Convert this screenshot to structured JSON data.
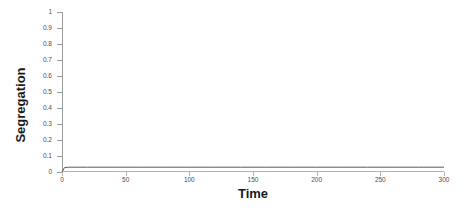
{
  "chart_data": {
    "type": "line",
    "title": "",
    "xlabel": "Time",
    "ylabel": "Segregation",
    "xlim": [
      0,
      300
    ],
    "ylim": [
      0,
      1
    ],
    "xticks": [
      0,
      50,
      100,
      150,
      200,
      250,
      300
    ],
    "xtick_labels": [
      "0",
      "50",
      "100",
      "150",
      "200",
      "250",
      "300"
    ],
    "yticks": [
      0,
      0.1,
      0.2,
      0.3,
      0.4,
      0.5,
      0.6,
      0.7,
      0.8,
      0.9,
      1
    ],
    "ytick_labels": [
      "0",
      "0.1",
      "0.2",
      "0.3",
      "0.4",
      "0.5",
      "0.6",
      "0.7",
      "0.8",
      "0.9",
      "1"
    ],
    "grid": false,
    "legend": null,
    "legend_position": "none",
    "series": [
      {
        "name": "Segregation",
        "color": "#595959",
        "line_width": 1,
        "x": [
          0,
          2,
          5,
          10,
          20,
          40,
          60,
          80,
          100,
          120,
          140,
          160,
          180,
          200,
          220,
          240,
          260,
          280,
          300
        ],
        "y": [
          0.0,
          0.028,
          0.03,
          0.03,
          0.03,
          0.03,
          0.03,
          0.03,
          0.03,
          0.03,
          0.03,
          0.03,
          0.03,
          0.03,
          0.03,
          0.03,
          0.03,
          0.03,
          0.03
        ]
      }
    ]
  },
  "colors": {
    "background": "#ffffff",
    "axis": "#9a9a9a",
    "x_axis": "#b4b4b4",
    "tick_text": "#4d4d4d",
    "title_text": "#1a1a1a",
    "series_line": "#595959"
  }
}
